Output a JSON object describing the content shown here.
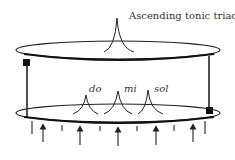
{
  "diagram": {
    "title": "Ascending tonic triad",
    "notes": [
      {
        "label": "do"
      },
      {
        "label": "mi"
      },
      {
        "label": "sol"
      }
    ],
    "colors": {
      "ink": "#222222",
      "text": "#333333",
      "background": "#ffffff"
    }
  }
}
